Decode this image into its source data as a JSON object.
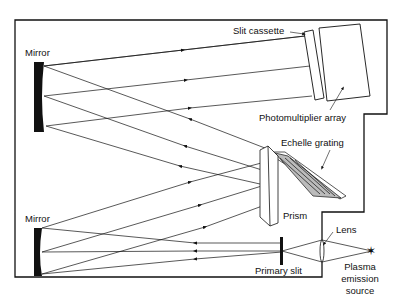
{
  "diagram": {
    "labels": {
      "mirror_top": "Mirror",
      "mirror_bottom": "Mirror",
      "slit_cassette": "Slit cassette",
      "photomultiplier_array": "Photomultiplier array",
      "echelle_grating": "Echelle grating",
      "prism": "Prism",
      "lens": "Lens",
      "primary_slit": "Primary slit",
      "source_line1": "Plasma",
      "source_line2": "emission",
      "source_line3": "source"
    },
    "colors": {
      "line": "#111111",
      "background": "#ffffff"
    }
  }
}
